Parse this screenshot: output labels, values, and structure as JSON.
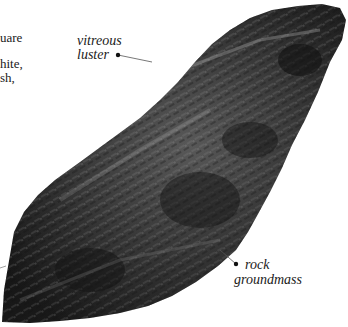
{
  "body_text_fragments": [
    {
      "text": "uare",
      "x": 0,
      "y": 31
    },
    {
      "text": "hite,",
      "x": 0,
      "y": 57
    },
    {
      "text": "sh,",
      "x": 0,
      "y": 71
    }
  ],
  "annotations": [
    {
      "id": "vitreous-luster",
      "line1": "vitreous",
      "line2": "luster"
    },
    {
      "id": "rock-groundmass",
      "line1": "rock",
      "line2": "groundmass"
    }
  ],
  "specimen": {
    "subject": "rock specimen photograph",
    "colors": {
      "dark": "#1c1c1c",
      "mid": "#4a4a4a",
      "light": "#9a9a9a",
      "leader": "#555555"
    }
  }
}
